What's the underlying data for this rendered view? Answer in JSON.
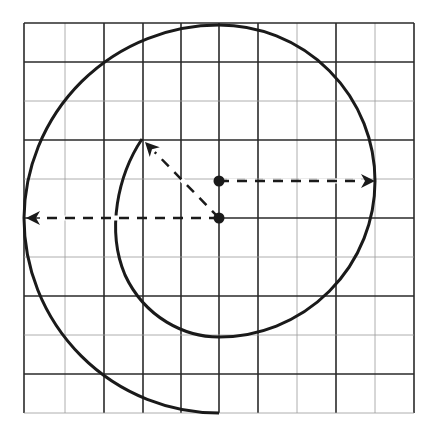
{
  "diagram": {
    "type": "spiral-construction-on-grid",
    "colors": {
      "background": "#ffffff",
      "stroke": "#1a1a1a",
      "grid_dark": "#2a2a2a",
      "grid_light": "#9a9a9a"
    },
    "grid": {
      "left": 24,
      "top": 23,
      "right": 414,
      "bottom": 413,
      "vertical_lines": [
        {
          "x": 24,
          "style": "dark"
        },
        {
          "x": 65,
          "style": "light"
        },
        {
          "x": 104,
          "style": "dark"
        },
        {
          "x": 143,
          "style": "dark"
        },
        {
          "x": 181,
          "style": "dark"
        },
        {
          "x": 219,
          "style": "dark"
        },
        {
          "x": 258,
          "style": "dark"
        },
        {
          "x": 297,
          "style": "light"
        },
        {
          "x": 336,
          "style": "dark"
        },
        {
          "x": 375,
          "style": "light"
        },
        {
          "x": 414,
          "style": "dark"
        }
      ],
      "horizontal_lines": [
        {
          "y": 23,
          "style": "dark"
        },
        {
          "y": 62,
          "style": "dark"
        },
        {
          "y": 101,
          "style": "light"
        },
        {
          "y": 140,
          "style": "dark"
        },
        {
          "y": 179,
          "style": "light"
        },
        {
          "y": 218,
          "style": "dark"
        },
        {
          "y": 257,
          "style": "light"
        },
        {
          "y": 296,
          "style": "dark"
        },
        {
          "y": 335,
          "style": "light"
        },
        {
          "y": 374,
          "style": "dark"
        },
        {
          "y": 413,
          "style": "light"
        }
      ]
    },
    "centers": [
      {
        "name": "upper-center",
        "x": 219,
        "y": 181
      },
      {
        "name": "lower-center",
        "x": 219,
        "y": 218
      }
    ],
    "radius_arrows": [
      {
        "name": "radius-arrow-right",
        "from": [
          219,
          181
        ],
        "to": [
          375,
          181
        ]
      },
      {
        "name": "radius-arrow-left",
        "from": [
          219,
          218
        ],
        "to": [
          26,
          218
        ]
      },
      {
        "name": "radius-arrow-diagonal",
        "from": [
          219,
          218
        ],
        "to": [
          145,
          142
        ]
      }
    ],
    "spiral_path": "M142,139 C118,175 106,230 125,275 C145,318 185,337 219,337 A156,156 0 0 0 219,25 A195,195 0 0 0 24,218 A195,195 0 0 0 219,413"
  }
}
